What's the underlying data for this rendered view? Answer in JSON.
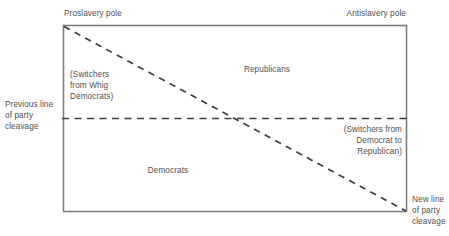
{
  "figure": {
    "type": "conceptual-diagram"
  },
  "axis_labels": {
    "top_left_pole": "Proslavery pole",
    "top_right_pole": "Antislavery pole"
  },
  "cleavage_lines": {
    "previous": {
      "label": "Previous line\nof party\ncleavage",
      "label_line_1": "Previous line",
      "label_line_2": "of party",
      "label_line_3": "cleavage",
      "orientation": "horizontal",
      "style": "dashed"
    },
    "new": {
      "label": "New line\nof party\ncleavage",
      "label_line_1": "New line",
      "label_line_2": "of party",
      "label_line_3": "cleavage",
      "orientation": "diagonal",
      "style": "dashed"
    }
  },
  "regions": {
    "republicans": "Republicans",
    "democrats": "Democrats",
    "switchers_whig": "(Switchers\nfrom Whig\nDemocrats)",
    "switchers_democrat_to_republican": "(Switchers from\nDemocrat to\nRepublican)"
  },
  "colors": {
    "background": "#ffffff",
    "frame_stroke": "#7d7d7d",
    "dash_stroke": "#3f3f3f",
    "text": "#4f4f4f"
  },
  "geometry": {
    "frame": {
      "x": 63,
      "y": 25,
      "width": 344,
      "height": 187
    },
    "horizontal_cleavage_y": 118,
    "diagonal_from": [
      63,
      26
    ],
    "diagonal_to": [
      406,
      211
    ]
  }
}
